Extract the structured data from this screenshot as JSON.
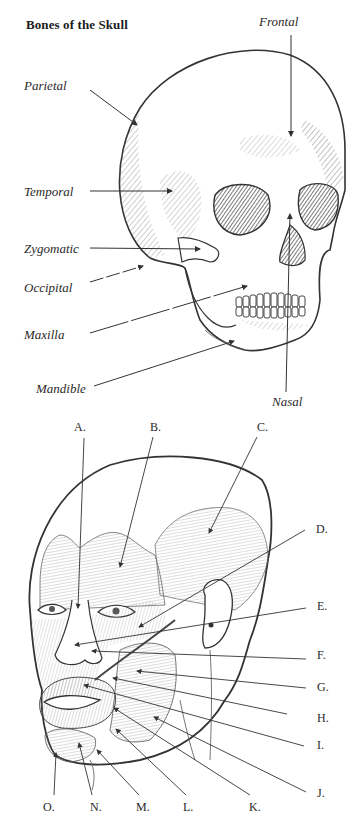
{
  "title": "Bones of the Skull",
  "bones": {
    "frontal": "Frontal",
    "parietal": "Parietal",
    "temporal": "Temporal",
    "zygomatic": "Zygomatic",
    "occipital": "Occipital",
    "maxilla": "Maxilla",
    "mandible": "Mandible",
    "nasal": "Nasal"
  },
  "muscles": {
    "labels": [
      "A.",
      "B.",
      "C.",
      "D.",
      "E.",
      "F.",
      "G.",
      "H.",
      "I.",
      "J.",
      "K.",
      "L.",
      "M.",
      "N.",
      "O."
    ]
  }
}
